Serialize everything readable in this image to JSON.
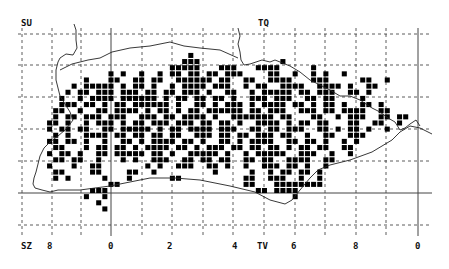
{
  "map": {
    "title": "Tetrad distribution map",
    "colors": {
      "background": "#ffffff",
      "grid": "#333333",
      "coast": "#222222",
      "square": "#000000"
    },
    "grid_labels": {
      "top_left": "SU",
      "top_right": "TQ",
      "bottom_left": "SZ",
      "bottom_mid": "TV"
    },
    "bottom_ticks": [
      "8",
      "0",
      "2",
      "4",
      "6",
      "8",
      "0"
    ],
    "grid": {
      "origin_x": 22,
      "origin_y": 34,
      "cell": 30.7,
      "vertical_lines": [
        22,
        52,
        81,
        111,
        142,
        172,
        203,
        233,
        264,
        295,
        325,
        356,
        386,
        418
      ],
      "solid_vertical": [
        111,
        418
      ],
      "horizontal_lines": [
        34,
        65,
        97,
        129,
        161,
        193,
        225,
        256
      ],
      "solid_horizontal": [
        193
      ]
    },
    "tetrad_rows": [
      "",
      "",
      "",
      "                           #                                    ",
      "                          ###             #                     ",
      "                        #####   ###   ####     #               ",
      "              # #  #  # ## ## ## ###    ##  #  # #  #           ",
      "          #   ##  ## ##  ###### ##  ##  ####   ###     ##  #    ",
      "        # ##### # ## #  # #### ###  # ##  ####  #### #  ##       ",
      "       # ## ### ### ## ## ### #  ##  # ##### ## ###  ## #       ",
      "      #  # #### ###### # ## ## ## #  ### ###  ## ##    #        ",
      "      ### ## # ## ###### #  ## # ### # #### ## # ## #  ## #     ",
      "     ##  #  ## #### # ## # ## ###### ## ###  ### ## ####  ##    ",
      "     # ## ### ###  ### ## #### #  ####### ##   ##  # ###  ## ##  ",
      "    ## #  # ### # ## ### ### ## ## #  #### # ## ##   ##  ##  #  ",
      "    # ## ##  ## ##### # ## #### ###  ## ## ###  ## # ## #  #    ",
      "     # #  #### ## ## ## ##  ### ## ## ### ##  #  ##  ###        ",
      "    ## ## #  #  ## # #### ## #  ## # ####  ## ## #  # #         ",
      "     ##   # ## ## # #### ## # ### ## ## ## # ## ##  ##          ",
      "    # ## #  ## ##### ## #  ##### #  # #####  ###  #  #           ",
      "     ## ##  #   # #  ###  ## ## ##  ## ##  ####  ##              ",
      "    #   #  ##       # #  ###  ## #  #  ### ## #  #               ",
      "     ##    ##    ##  #         #     #  # ## ## #                ",
      "     # #     #   #      ##          ##  ###  #  #                ",
      "              ##                    ##   ########                ",
      "           ###                        ## ####                    ",
      "          #  #                              #                    ",
      "            #                                                    ",
      "             #                                                   "
    ],
    "coast_path": "M76 40 L77 48 L73 55 L66 54 L60 58 L58 62 L56 70 L56 80 L58 88 L60 96 L65 104 L70 112 L73 120 L70 124 L65 130 L58 136 L50 142 L44 148 L40 156 L38 164 L36 172 L34 178 L33 184 L35 188 L42 190 L50 192 L58 190 L66 190 L80 190 L95 188 L110 186 L130 182 L150 178 L175 178 L200 180 L230 186 L255 192 L270 200 L285 204 L292 200 L300 190 L310 178 L318 170 L330 165 L350 160 L372 152 L392 140 L400 132 L410 126 L420 128 L432 134 M76 40 L76 30 L74 24 M238 28 L240 36 L238 44 L240 52 L241 60 L244 65 L250 64 L256 62 L262 60 L270 62 L275 60 L290 66 L300 72 L310 80 L318 84 L330 90 L340 96 L350 96 L360 100 L372 108 L380 112 L388 118 L395 122 L400 130 L405 128 L410 124 L416 120 L420 126 M60 70 L72 64 L88 60 L100 58 L112 52 L130 48 L150 46 L170 42 L184 46 L200 48 L220 50 L238 58"
  }
}
